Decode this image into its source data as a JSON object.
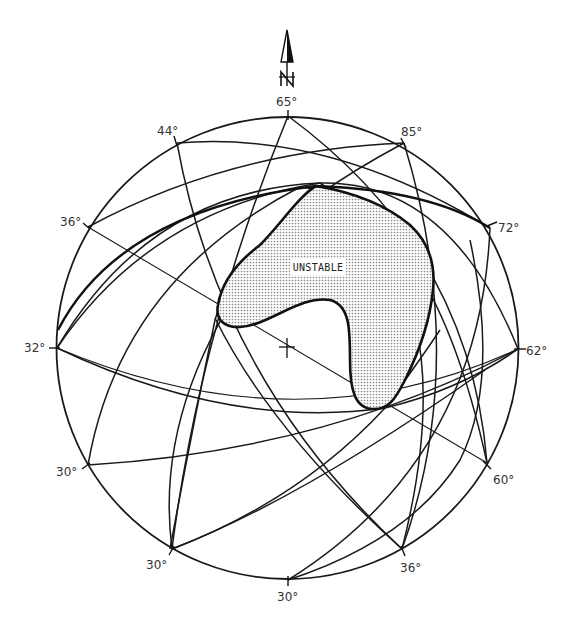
{
  "diagram": {
    "type": "stereonet",
    "north_arrow": {
      "label": "N",
      "icon": "north-arrow-icon"
    },
    "center_marker": {
      "icon": "crosshair-icon"
    },
    "region_label": "UNSTABLE",
    "colors": {
      "line": "#1a1a1a",
      "fill": "#c8c8c8",
      "background": "#ffffff"
    },
    "dip_labels": [
      {
        "id": "top",
        "text": "65°"
      },
      {
        "id": "ne1",
        "text": "85°"
      },
      {
        "id": "ne2",
        "text": "72°"
      },
      {
        "id": "e",
        "text": "62°"
      },
      {
        "id": "se1",
        "text": "60°"
      },
      {
        "id": "se2",
        "text": "36°"
      },
      {
        "id": "s",
        "text": "30°"
      },
      {
        "id": "sw1",
        "text": "30°"
      },
      {
        "id": "sw2",
        "text": "30°"
      },
      {
        "id": "w",
        "text": "32°"
      },
      {
        "id": "nw1",
        "text": "36°"
      },
      {
        "id": "nw2",
        "text": "44°"
      }
    ]
  }
}
